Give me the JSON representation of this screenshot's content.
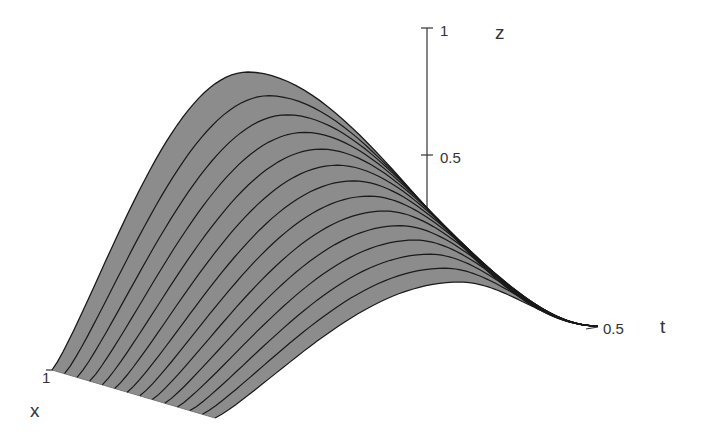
{
  "chart_data": {
    "type": "surface3d",
    "title": "",
    "axes": {
      "x": {
        "label": "x",
        "ticks": [
          "1"
        ]
      },
      "t": {
        "label": "t",
        "ticks": [
          "0.5"
        ]
      },
      "z": {
        "label": "z",
        "ticks": [
          "0.5",
          "1"
        ],
        "range": [
          0,
          1
        ]
      }
    },
    "surface": {
      "fill_color": "#8c8c8c",
      "line_color": "#1a1a1a",
      "num_curves": 14,
      "description": "Surface z(x,t); family of 14 curves at successive x values, each rising from the x=1 front edge to a peak then decaying to zero at t=0.5",
      "peak_z_approx": [
        0.97,
        0.89,
        0.81,
        0.74,
        0.67,
        0.6,
        0.54,
        0.48,
        0.42,
        0.37,
        0.32,
        0.27,
        0.23,
        0.19
      ]
    },
    "grid": false,
    "legend": null
  },
  "labels": {
    "z_title": "z",
    "t_title": "t",
    "x_title": "x",
    "z_tick_1": "1",
    "z_tick_05": "0.5",
    "t_tick_05": "0.5",
    "x_tick_1": "1"
  },
  "colors": {
    "surface": "#8c8c8c",
    "curve": "#1a1a1a",
    "axis": "#333333",
    "background": "#ffffff"
  }
}
